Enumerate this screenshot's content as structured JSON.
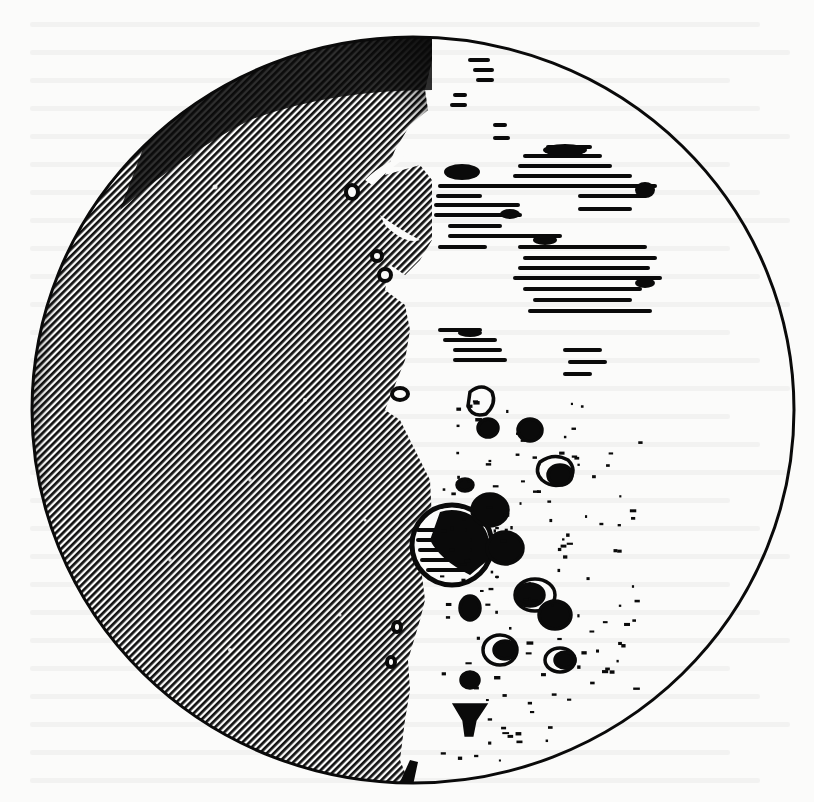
{
  "figure": {
    "colors": {
      "paper": "#fbfbfa",
      "ink": "#0a0a0a",
      "shadow_hatch": "#111111"
    },
    "moon_disc": {
      "cx": 413,
      "cy": 410,
      "rx": 381,
      "ry": 373,
      "outline_width": 3
    },
    "terminator_x_range": [
      400,
      470
    ],
    "large_crater": {
      "cx": 452,
      "cy": 545,
      "r": 40
    },
    "note": "Faint illegible bleed-through text from reverse of page visible across background"
  }
}
